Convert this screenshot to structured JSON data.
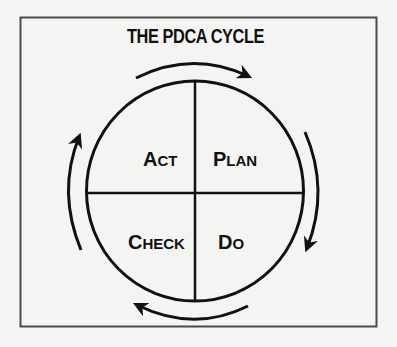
{
  "diagram": {
    "title": "THE PDCA CYCLE",
    "quadrants": [
      {
        "position": "top-left",
        "first": "A",
        "rest": "CT",
        "full": "Act"
      },
      {
        "position": "top-right",
        "first": "P",
        "rest": "LAN",
        "full": "Plan"
      },
      {
        "position": "bottom-left",
        "first": "C",
        "rest": "HECK",
        "full": "Check"
      },
      {
        "position": "bottom-right",
        "first": "D",
        "rest": "O",
        "full": "Do"
      }
    ],
    "arrows": [
      {
        "name": "arrow-top",
        "direction": "clockwise",
        "from": "Act",
        "to": "Plan"
      },
      {
        "name": "arrow-right",
        "direction": "clockwise",
        "from": "Plan",
        "to": "Do"
      },
      {
        "name": "arrow-bottom",
        "direction": "clockwise",
        "from": "Do",
        "to": "Check"
      },
      {
        "name": "arrow-left",
        "direction": "clockwise",
        "from": "Check",
        "to": "Act"
      }
    ],
    "colors": {
      "background": "#f4f4f2",
      "stroke": "#111111",
      "frame": "#4a4a4a"
    }
  }
}
